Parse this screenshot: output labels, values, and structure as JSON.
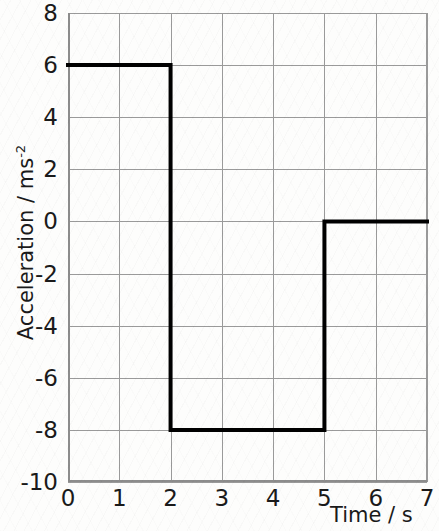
{
  "chart_data": {
    "type": "line",
    "title": "",
    "subtitle": "",
    "xlabel": "Time / s",
    "ylabel_text": "Acceleration / ms",
    "ylabel_superscript": "-2",
    "ylabel_full": "Acceleration / ms-2",
    "xlim": [
      0,
      7
    ],
    "ylim": [
      -10,
      8
    ],
    "xticks": [
      0,
      1,
      2,
      3,
      4,
      5,
      6,
      7
    ],
    "xtick_labels": [
      "0",
      "1",
      "2",
      "3",
      "4",
      "5",
      "6",
      "7"
    ],
    "yticks": [
      8,
      6,
      4,
      2,
      0,
      -2,
      -4,
      -6,
      -8,
      -10
    ],
    "ytick_labels": [
      "8",
      "6",
      "4",
      "2",
      "0",
      "-2",
      "-4",
      "-6",
      "-8",
      "-10"
    ],
    "grid": true,
    "grid_x_step": 1,
    "grid_y_step": 2,
    "legend": "none",
    "series": [
      {
        "name": "Acceleration",
        "style": "step",
        "color": "#000000",
        "line_width": 4,
        "points": [
          {
            "x": 0,
            "y": 6
          },
          {
            "x": 2,
            "y": 6
          },
          {
            "x": 2,
            "y": -8
          },
          {
            "x": 5,
            "y": -8
          },
          {
            "x": 5,
            "y": 0
          },
          {
            "x": 7,
            "y": 0
          }
        ],
        "segments": [
          {
            "from_x": 0,
            "to_x": 2,
            "value": 6
          },
          {
            "from_x": 2,
            "to_x": 5,
            "value": -8
          },
          {
            "from_x": 5,
            "to_x": 7,
            "value": 0
          }
        ]
      }
    ],
    "colors": {
      "series_line": "#000000",
      "gridline": "#9a9a9a",
      "axis": "#8c8c8c",
      "text": "#1a1a1a",
      "background": "#fdfdfc"
    }
  }
}
